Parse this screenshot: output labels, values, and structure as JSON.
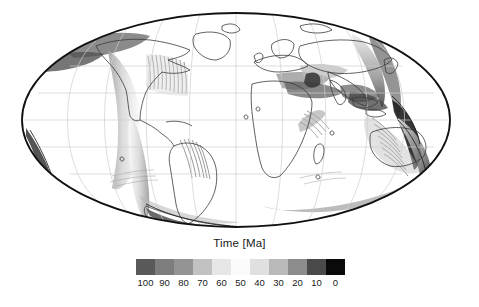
{
  "figure": {
    "background_color": "#ffffff",
    "width": 479,
    "height": 307
  },
  "map": {
    "projection": "Mollweide",
    "central_meridian": 0,
    "graticule": {
      "visible": true,
      "meridian_interval_deg": 30,
      "parallel_interval_deg": 30,
      "color": "#cfcfcf"
    },
    "outline_color": "#111111",
    "coastline_color": "#3a3a3a",
    "land_fill": "#ffffff"
  },
  "colorbar": {
    "title": "Time [Ma]",
    "orientation": "horizontal",
    "vmin": 0,
    "vmax": 100,
    "units": "Ma",
    "tick_labels": [
      "100",
      "90",
      "80",
      "70",
      "60",
      "50",
      "40",
      "30",
      "20",
      "10",
      "0"
    ],
    "tick_values": [
      100,
      90,
      80,
      70,
      60,
      50,
      40,
      30,
      20,
      10,
      0
    ],
    "segment_colors": [
      "#595959",
      "#7d7d7d",
      "#949494",
      "#c2c2c2",
      "#e6e6e6",
      "#fbfbfb",
      "#e0e0e0",
      "#b9b9b9",
      "#8c8c8c",
      "#4a4a4a",
      "#0a0a0a"
    ]
  },
  "chart_data": {
    "type": "heatmap",
    "title": "Time [Ma]",
    "xlabel": "",
    "ylabel": "",
    "projection": "Mollweide",
    "colorbar_label": "Time [Ma]",
    "colorbar_ticks": [
      100,
      90,
      80,
      70,
      60,
      50,
      40,
      30,
      20,
      10,
      0
    ],
    "colorbar_range": [
      0,
      100
    ],
    "colormap": "grayscale-cyclic",
    "grid": true,
    "legend_position": "bottom"
  }
}
